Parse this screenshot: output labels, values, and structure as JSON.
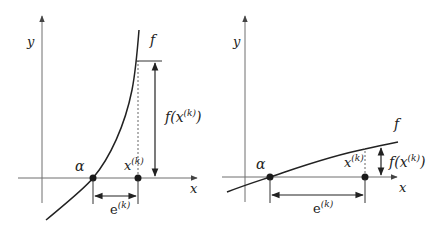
{
  "figure": {
    "panels": [
      {
        "id": "left",
        "description": "Steep function: small error e(k), large residual f(x(k))",
        "axis_x_label": "x",
        "axis_y_label": "y",
        "curve_label": "f",
        "root_label": "α",
        "iterate_label": "x",
        "iterate_sup": "(k)",
        "error_label": "e",
        "error_sup": "(k)",
        "residual_label_pre": "f(x",
        "residual_sup": "(k)",
        "residual_label_post": ")"
      },
      {
        "id": "right",
        "description": "Flat function: large error e(k), small residual f(x(k))",
        "axis_x_label": "x",
        "axis_y_label": "y",
        "curve_label": "f",
        "root_label": "α",
        "iterate_label": "x",
        "iterate_sup": "(k)",
        "error_label": "e",
        "error_sup": "(k)",
        "residual_label_pre": "f(x",
        "residual_sup": "(k)",
        "residual_label_post": ")"
      }
    ],
    "colors": {
      "axis": "#6e6e6e",
      "curve": "#222222",
      "point": "#1a1a1a",
      "background": "#ffffff"
    }
  }
}
